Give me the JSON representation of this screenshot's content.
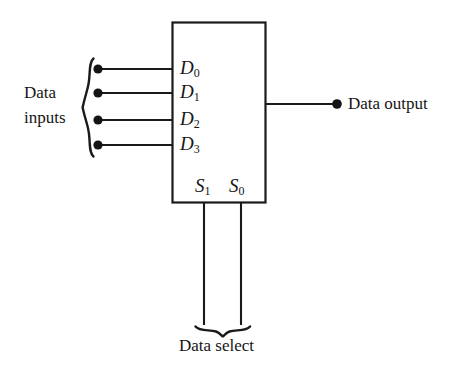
{
  "diagram": {
    "type": "logic-block-diagram",
    "colors": {
      "background": "#ffffff",
      "stroke": "#1a1a1a",
      "text": "#161616"
    },
    "block": {
      "name": "multiplexer-block",
      "x": 172,
      "y": 22,
      "width": 94,
      "height": 181
    },
    "data_inputs": {
      "group_label_line1": "Data",
      "group_label_line2": "inputs",
      "brace": "left-curly-brace",
      "ports": [
        {
          "label": "D",
          "subscript": "0",
          "y": 69
        },
        {
          "label": "D",
          "subscript": "1",
          "y": 93
        },
        {
          "label": "D",
          "subscript": "2",
          "y": 120
        },
        {
          "label": "D",
          "subscript": "3",
          "y": 145
        }
      ],
      "terminal_x": 98,
      "line_end_x": 172
    },
    "data_output": {
      "label": "Data output",
      "line_start_x": 266,
      "terminal_x": 337,
      "y": 104
    },
    "data_select": {
      "label": "Data select",
      "brace": "bottom-curly-brace",
      "ports": [
        {
          "label": "S",
          "subscript": "1",
          "x": 204
        },
        {
          "label": "S",
          "subscript": "0",
          "x": 241
        }
      ],
      "line_top_y": 203,
      "line_bottom_y": 325
    }
  }
}
